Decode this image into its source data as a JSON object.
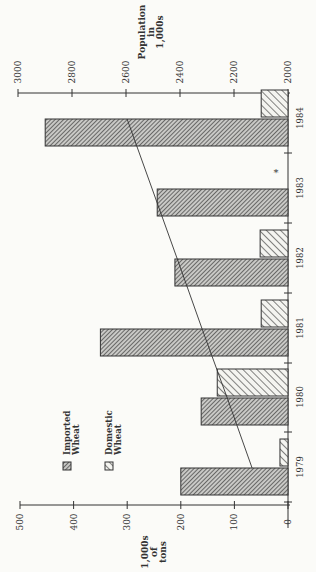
{
  "chart_data": {
    "type": "bar",
    "orientation": "rotated 90deg counterclockwise (page printed sideways)",
    "title": "",
    "categories": [
      "1979",
      "1980",
      "1981",
      "1982",
      "1983",
      "1984"
    ],
    "series": [
      {
        "name": "Imported Wheat",
        "values": [
          200,
          162,
          350,
          211,
          244,
          453
        ],
        "pattern": "dense-hatch"
      },
      {
        "name": "Domestic Wheat",
        "values": [
          15,
          132,
          50,
          52,
          0,
          50
        ],
        "pattern": "sparse-hatch"
      }
    ],
    "line_series": {
      "name": "Population",
      "axis": "secondary",
      "values": [
        2133,
        2225,
        2318,
        2410,
        2503,
        2596
      ]
    },
    "ylabel": "1,000s of tons",
    "ylim": [
      0,
      500
    ],
    "yticks": [
      "0",
      "100",
      "200",
      "300",
      "400",
      "500"
    ],
    "y2label": "Population in 1,000s",
    "y2lim": [
      2000,
      3000
    ],
    "y2ticks": [
      "2000",
      "2200",
      "2400",
      "2600",
      "2800",
      "3000"
    ],
    "annotations": [
      {
        "category": "1983",
        "text": "*"
      }
    ],
    "legend": [
      "Imported Wheat",
      "Domestic Wheat"
    ],
    "grid": false
  },
  "labels": {
    "ylabel_lines": [
      "1,000s",
      "of",
      "tons"
    ],
    "y2label_lines": [
      "Population",
      "in",
      "1,000s"
    ],
    "legend_imported": [
      "Imported",
      "Wheat"
    ],
    "legend_domestic": [
      "Domestic",
      "Wheat"
    ],
    "asterisk": "*"
  }
}
